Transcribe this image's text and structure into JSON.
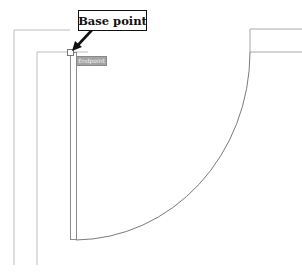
{
  "callout": {
    "label": "Base point"
  },
  "snap_tooltip": {
    "label": "Endpoint"
  },
  "colors": {
    "wall_line": "#bdbdbd",
    "door_line": "#8c8c8c",
    "arc_line": "#7a7a7a",
    "arrow": "#111111",
    "tooltip_bg": "#a3a3a3"
  }
}
